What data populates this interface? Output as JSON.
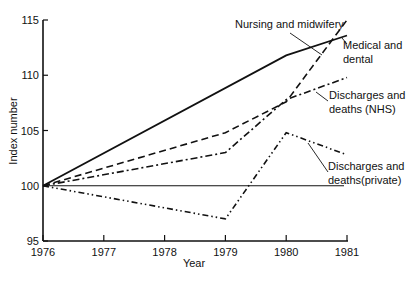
{
  "chart_data": {
    "type": "line",
    "title": "",
    "xlabel": "Year",
    "ylabel": "Index number",
    "x": [
      1976,
      1977,
      1978,
      1979,
      1980,
      1981
    ],
    "xticks": [
      "1976",
      "1977",
      "1978",
      "1979",
      "1980",
      "1981"
    ],
    "yticks": [
      "95",
      "100",
      "105",
      "110",
      "115"
    ],
    "ylim": [
      95,
      115
    ],
    "xlim": [
      1976,
      1981
    ],
    "grid": false,
    "legend": "inline annotations",
    "series": [
      {
        "name": "Nursing and midwifery",
        "style": "solid",
        "x": [
          1976,
          1980,
          1981
        ],
        "values": [
          100,
          111.8,
          113.6
        ]
      },
      {
        "name": "Medical and dental",
        "style": "dashed",
        "x": [
          1976,
          1979,
          1980,
          1981
        ],
        "values": [
          100,
          104.8,
          107.6,
          115
        ]
      },
      {
        "name": "Discharges and deaths (NHS)",
        "style": "dash-dot",
        "x": [
          1976,
          1979,
          1980,
          1981
        ],
        "values": [
          100,
          103,
          107.8,
          109.8
        ]
      },
      {
        "name": "Discharges and deaths (private)",
        "style": "dash-dot-dot",
        "x": [
          1976,
          1979,
          1980,
          1981
        ],
        "values": [
          100,
          97,
          104.8,
          102.8
        ]
      }
    ],
    "reference_line": {
      "y": 100,
      "x": [
        1976,
        1981
      ]
    },
    "annotations": [
      {
        "lines": [
          "Nursing and midwifery"
        ]
      },
      {
        "lines": [
          "Medical and",
          "dental"
        ]
      },
      {
        "lines": [
          "Discharges and",
          "deaths (NHS)"
        ]
      },
      {
        "lines": [
          "Discharges and",
          "deaths(private)"
        ]
      }
    ]
  }
}
